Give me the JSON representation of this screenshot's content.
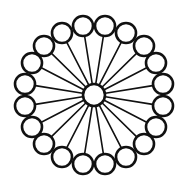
{
  "diagram": {
    "type": "hub-and-spoke",
    "canvas": {
      "width": 190,
      "height": 189,
      "background": "#ffffff"
    },
    "style": {
      "line_color": "#111111",
      "node_fill": "#ffffff",
      "node_stroke": "#111111",
      "node_stroke_width": 2.6,
      "spoke_stroke_width": 1.6
    },
    "hub": {
      "label": "center-hub",
      "cx": 94,
      "cy": 95,
      "r": 11
    },
    "ring": {
      "count": 20,
      "radius": 70,
      "node_radius": 10,
      "start_angle_deg": -81,
      "angle_step_deg": 18
    },
    "nodes": [
      {
        "id": 1,
        "angle_deg": -81,
        "cx": 105,
        "cy": 26
      },
      {
        "id": 2,
        "angle_deg": -63,
        "cx": 126,
        "cy": 33
      },
      {
        "id": 3,
        "angle_deg": -45,
        "cx": 144,
        "cy": 46
      },
      {
        "id": 4,
        "angle_deg": -27,
        "cx": 156,
        "cy": 63
      },
      {
        "id": 5,
        "angle_deg": -9,
        "cx": 163,
        "cy": 84
      },
      {
        "id": 6,
        "angle_deg": 9,
        "cx": 163,
        "cy": 106
      },
      {
        "id": 7,
        "angle_deg": 27,
        "cx": 156,
        "cy": 127
      },
      {
        "id": 8,
        "angle_deg": 45,
        "cx": 144,
        "cy": 144
      },
      {
        "id": 9,
        "angle_deg": 63,
        "cx": 126,
        "cy": 157
      },
      {
        "id": 10,
        "angle_deg": 81,
        "cx": 105,
        "cy": 164
      },
      {
        "id": 11,
        "angle_deg": 99,
        "cx": 83,
        "cy": 164
      },
      {
        "id": 12,
        "angle_deg": 117,
        "cx": 62,
        "cy": 157
      },
      {
        "id": 13,
        "angle_deg": 135,
        "cx": 44,
        "cy": 144
      },
      {
        "id": 14,
        "angle_deg": 153,
        "cx": 32,
        "cy": 127
      },
      {
        "id": 15,
        "angle_deg": 171,
        "cx": 25,
        "cy": 106
      },
      {
        "id": 16,
        "angle_deg": 189,
        "cx": 25,
        "cy": 84
      },
      {
        "id": 17,
        "angle_deg": 207,
        "cx": 32,
        "cy": 63
      },
      {
        "id": 18,
        "angle_deg": 225,
        "cx": 44,
        "cy": 46
      },
      {
        "id": 19,
        "angle_deg": 243,
        "cx": 62,
        "cy": 33
      },
      {
        "id": 20,
        "angle_deg": 261,
        "cx": 83,
        "cy": 26
      }
    ]
  }
}
